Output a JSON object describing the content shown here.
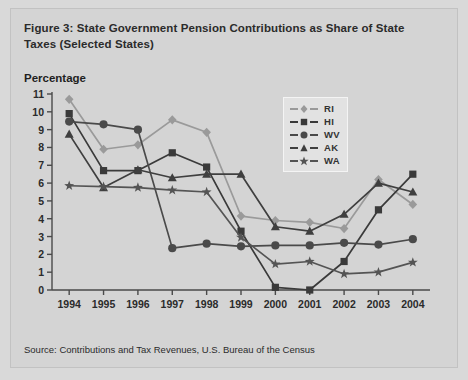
{
  "figure": {
    "title": "Figure 3: State Government Pension Contributions as Share of State Taxes (Selected States)",
    "y_axis_label": "Percentage",
    "source": "Source: Contributions and Tax Revenues, U.S. Bureau of the Census"
  },
  "legend": {
    "position": "top-right",
    "items": [
      {
        "label": "RI",
        "marker": "diamond",
        "color": "#9a9a9a"
      },
      {
        "label": "HI",
        "marker": "square",
        "color": "#3a3a3a"
      },
      {
        "label": "WV",
        "marker": "circle",
        "color": "#4a4a4a"
      },
      {
        "label": "AK",
        "marker": "triangle",
        "color": "#3f3f3f"
      },
      {
        "label": "WA",
        "marker": "star",
        "color": "#545454"
      }
    ]
  },
  "chart_data": {
    "type": "line",
    "title": "Figure 3: State Government Pension Contributions as Share of State Taxes (Selected States)",
    "xlabel": "",
    "ylabel": "Percentage",
    "x": [
      "1994",
      "1995",
      "1996",
      "1997",
      "1998",
      "1999",
      "2000",
      "2001",
      "2002",
      "2003",
      "2004"
    ],
    "categories": [
      "1994",
      "1995",
      "1996",
      "1997",
      "1998",
      "1999",
      "2000",
      "2001",
      "2002",
      "2003",
      "2004"
    ],
    "ylim": [
      0,
      11
    ],
    "ytick_values": [
      0,
      1,
      2,
      3,
      4,
      5,
      6,
      7,
      8,
      9,
      10,
      11
    ],
    "ytick_labels": [
      "0",
      "1",
      "2",
      "3",
      "4",
      "5",
      "6",
      "7",
      "8",
      "9",
      "10",
      "11"
    ],
    "grid": false,
    "legend_position": "top-right",
    "series": [
      {
        "name": "RI",
        "marker": "diamond",
        "color": "#9a9a9a",
        "values": [
          10.7,
          7.9,
          8.15,
          9.55,
          8.85,
          4.15,
          3.9,
          3.8,
          3.45,
          6.2,
          4.8
        ]
      },
      {
        "name": "HI",
        "marker": "square",
        "color": "#3a3a3a",
        "values": [
          9.9,
          6.7,
          6.7,
          7.7,
          6.9,
          3.3,
          0.15,
          0.0,
          1.6,
          4.5,
          6.5
        ]
      },
      {
        "name": "WV",
        "marker": "circle",
        "color": "#4a4a4a",
        "values": [
          9.45,
          9.3,
          9.0,
          2.35,
          2.6,
          2.45,
          2.5,
          2.5,
          2.65,
          2.55,
          2.85
        ]
      },
      {
        "name": "AK",
        "marker": "triangle",
        "color": "#3f3f3f",
        "values": [
          8.75,
          5.75,
          6.75,
          6.3,
          6.5,
          6.5,
          3.55,
          3.3,
          4.25,
          6.0,
          5.5
        ]
      },
      {
        "name": "WA",
        "marker": "star",
        "color": "#545454",
        "values": [
          5.85,
          5.8,
          5.75,
          5.6,
          5.5,
          2.95,
          1.45,
          1.6,
          0.9,
          1.0,
          1.55
        ]
      }
    ]
  },
  "colors": {
    "page_background": "#d9d9d9",
    "panel_background": "#d4d4d4",
    "axis": "#4a4a4a",
    "text": "#2b2b2b"
  }
}
